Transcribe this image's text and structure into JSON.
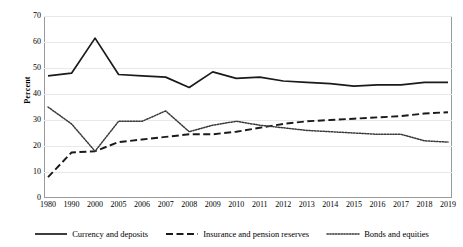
{
  "chart_data": {
    "type": "line",
    "title": "",
    "xlabel": "",
    "ylabel": "Percent",
    "ylim": [
      0,
      70
    ],
    "ytick_step": 10,
    "yticks": [
      70,
      60,
      50,
      40,
      30,
      20,
      10,
      0
    ],
    "grid": true,
    "grid_axis": "y",
    "legend_position": "bottom",
    "categories": [
      "1980",
      "1990",
      "2000",
      "2005",
      "2006",
      "2007",
      "2008",
      "2009",
      "2010",
      "2011",
      "2012",
      "2013",
      "2014",
      "2015",
      "2016",
      "2017",
      "2018",
      "2019"
    ],
    "series": [
      {
        "name": "Currency and deposits",
        "style": "solid",
        "color": "#1a1a1a",
        "values": [
          47,
          48,
          61.5,
          47.5,
          47,
          46.5,
          42.5,
          48.5,
          46,
          46.5,
          45,
          44.5,
          44,
          43,
          43.5,
          43.5,
          44.5,
          44.5
        ]
      },
      {
        "name": "Insurance and pension reserves",
        "style": "dashed",
        "color": "#1a1a1a",
        "values": [
          8,
          17.5,
          18,
          21.5,
          22.5,
          23.5,
          24.5,
          24.5,
          25.5,
          27,
          28.5,
          29.5,
          30,
          30.5,
          31,
          31.5,
          32.5,
          33
        ]
      },
      {
        "name": "Bonds and equities",
        "style": "dotted",
        "color": "#3a3a3a",
        "values": [
          35,
          28.5,
          18,
          29.5,
          29.5,
          33.5,
          25.5,
          28,
          29.5,
          28,
          27,
          26,
          25.5,
          25,
          24.5,
          24.5,
          22,
          21.5
        ]
      }
    ]
  },
  "axes": {
    "y_title": "Percent",
    "y_tick_labels": [
      "70",
      "60",
      "50",
      "40",
      "30",
      "20",
      "10",
      "0"
    ],
    "x_tick_labels": [
      "1980",
      "1990",
      "2000",
      "2005",
      "2006",
      "2007",
      "2008",
      "2009",
      "2010",
      "2011",
      "2012",
      "2013",
      "2014",
      "2015",
      "2016",
      "2017",
      "2018",
      "2019"
    ]
  },
  "legend": {
    "items": [
      {
        "label": "Currency and deposits",
        "style": "solid"
      },
      {
        "label": "Insurance and pension reserves",
        "style": "dashed"
      },
      {
        "label": "Bonds and equities",
        "style": "dotted"
      }
    ]
  },
  "colors": {
    "line": "#1a1a1a",
    "dotted_line": "#3a3a3a",
    "grid": "#e8e8e8",
    "frame": "#9a9a9a",
    "background": "#ffffff",
    "text": "#000000"
  }
}
